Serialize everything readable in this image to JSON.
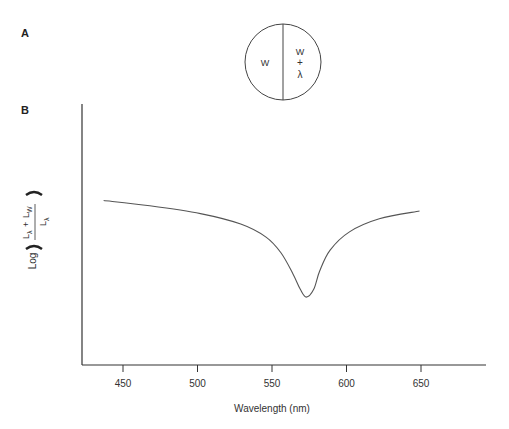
{
  "panels": {
    "a": {
      "label": "A"
    },
    "b": {
      "label": "B"
    }
  },
  "bipartite_field": {
    "left_label": "W",
    "right_label_top": "W",
    "right_label_plus": "+",
    "right_label_bottom": "λ"
  },
  "colors": {
    "line": "#555555",
    "axis": "#333333",
    "text": "#333333"
  },
  "chart_data": {
    "type": "line",
    "title": "",
    "xlabel": "Wavelength (nm)",
    "ylabel": "Log ( (Lλ + Lw) / Lλ )",
    "ylabel_parts": {
      "log": "Log",
      "numerator_left": "L",
      "numerator_left_sub": "λ",
      "plus": "+",
      "numerator_right": "L",
      "numerator_right_sub": "W",
      "denominator": "L",
      "denominator_sub": "λ"
    },
    "x_ticks": [
      450,
      500,
      550,
      600,
      650
    ],
    "xlim": [
      424,
      690
    ],
    "ylim": [
      0,
      1
    ],
    "grid": false,
    "legend": null,
    "series": [
      {
        "name": "threshold",
        "x": [
          437,
          468,
          502,
          529,
          546,
          556,
          564,
          569,
          573,
          578,
          582,
          589,
          602,
          622,
          649
        ],
        "y": [
          0.63,
          0.61,
          0.58,
          0.54,
          0.49,
          0.43,
          0.35,
          0.29,
          0.26,
          0.29,
          0.36,
          0.44,
          0.51,
          0.56,
          0.59
        ]
      }
    ]
  }
}
